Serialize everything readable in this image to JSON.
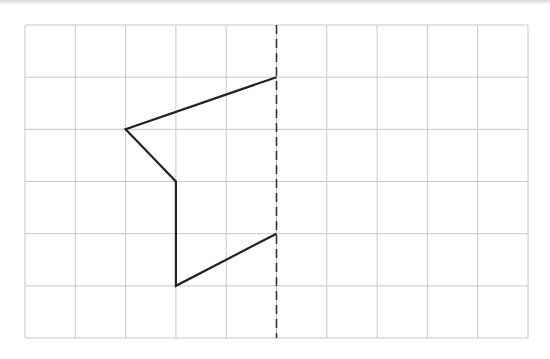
{
  "diagram": {
    "type": "reflection-grid",
    "grid": {
      "columns": 10,
      "rows": 6,
      "origin_px": [
        25,
        25
      ],
      "end_px": [
        528,
        338
      ],
      "line_color": "#c8c8c8"
    },
    "mirror_line": {
      "style": "dashed",
      "grid_x": 5,
      "color": "#333333"
    },
    "shape": {
      "stroke_color": "#222222",
      "vertices_grid": [
        [
          5,
          1
        ],
        [
          2,
          2
        ],
        [
          3,
          3
        ],
        [
          3,
          5
        ],
        [
          5,
          4
        ]
      ],
      "closed": false
    }
  }
}
